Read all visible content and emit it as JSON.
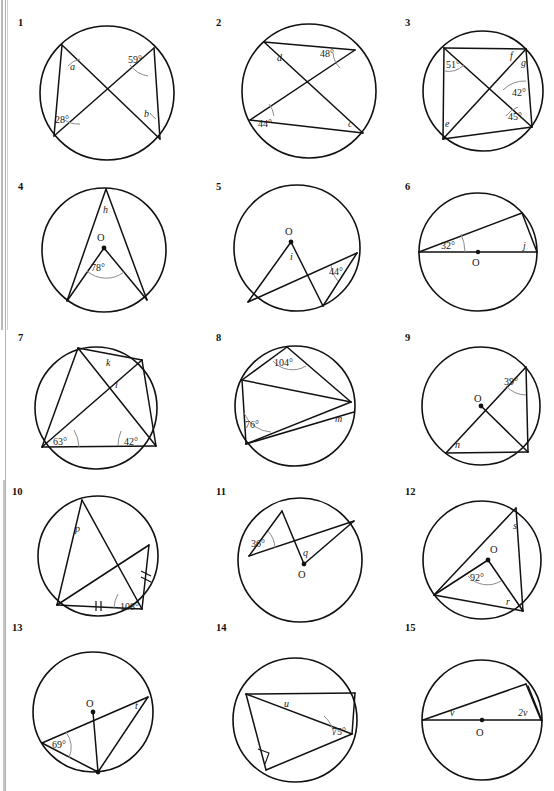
{
  "worksheet": {
    "title": "Circle theorems exercise sheet",
    "page_width": 554,
    "page_height": 791,
    "center_label": "O"
  },
  "problems": [
    {
      "number": "1",
      "labels": [
        "a",
        "28°",
        "59°",
        "b"
      ],
      "angles": [
        "28°",
        "59°"
      ],
      "unknowns": [
        "a",
        "b"
      ],
      "center_marked": false
    },
    {
      "number": "2",
      "labels": [
        "d",
        "48°",
        "44°",
        "c"
      ],
      "angles": [
        "48°",
        "44°"
      ],
      "unknowns": [
        "c",
        "d"
      ],
      "center_marked": false
    },
    {
      "number": "3",
      "labels": [
        "51°",
        "f",
        "g",
        "42°",
        "e",
        "45°"
      ],
      "angles": [
        "51°",
        "42°",
        "45°"
      ],
      "unknowns": [
        "e",
        "f",
        "g"
      ],
      "center_marked": false
    },
    {
      "number": "4",
      "labels": [
        "h",
        "O",
        "78°"
      ],
      "angles": [
        "78°"
      ],
      "unknowns": [
        "h"
      ],
      "center_marked": true
    },
    {
      "number": "5",
      "labels": [
        "O",
        "i",
        "44°"
      ],
      "angles": [
        "44°"
      ],
      "unknowns": [
        "i"
      ],
      "center_marked": true
    },
    {
      "number": "6",
      "labels": [
        "32°",
        "j",
        "O"
      ],
      "angles": [
        "32°"
      ],
      "unknowns": [
        "j"
      ],
      "center_marked": true
    },
    {
      "number": "7",
      "labels": [
        "k",
        "l",
        "63°",
        "42°"
      ],
      "angles": [
        "63°",
        "42°"
      ],
      "unknowns": [
        "k",
        "l"
      ],
      "center_marked": false
    },
    {
      "number": "8",
      "labels": [
        "104°",
        "76°",
        "m"
      ],
      "angles": [
        "104°",
        "76°"
      ],
      "unknowns": [
        "m"
      ],
      "center_marked": false
    },
    {
      "number": "9",
      "labels": [
        "39°",
        "O",
        "n"
      ],
      "angles": [
        "39°"
      ],
      "unknowns": [
        "n"
      ],
      "center_marked": true
    },
    {
      "number": "10",
      "labels": [
        "p",
        "108°"
      ],
      "angles": [
        "108°"
      ],
      "unknowns": [
        "p"
      ],
      "center_marked": false,
      "tick_marks": [
        "double-tick-base",
        "double-tick-right"
      ]
    },
    {
      "number": "11",
      "labels": [
        "36°",
        "q",
        "O"
      ],
      "angles": [
        "36°"
      ],
      "unknowns": [
        "q"
      ],
      "center_marked": true
    },
    {
      "number": "12",
      "labels": [
        "s",
        "O",
        "92°",
        "r"
      ],
      "angles": [
        "92°"
      ],
      "unknowns": [
        "r",
        "s"
      ],
      "center_marked": true
    },
    {
      "number": "13",
      "labels": [
        "O",
        "t",
        "69°"
      ],
      "angles": [
        "69°"
      ],
      "unknowns": [
        "t"
      ],
      "center_marked": true
    },
    {
      "number": "14",
      "labels": [
        "u",
        "75°"
      ],
      "angles": [
        "75°"
      ],
      "unknowns": [
        "u"
      ],
      "center_marked": false,
      "right_angle_marked": true
    },
    {
      "number": "15",
      "labels": [
        "v",
        "2v",
        "O"
      ],
      "angles": [],
      "unknowns": [
        "v",
        "2v"
      ],
      "center_marked": true
    }
  ]
}
